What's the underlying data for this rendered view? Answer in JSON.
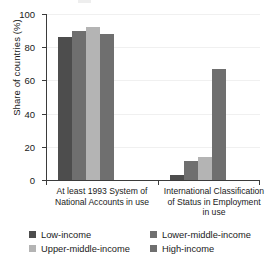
{
  "chart_data": {
    "type": "bar",
    "title": "",
    "xlabel": "",
    "ylabel": "Share of countries (%)",
    "ylim": [
      0,
      100
    ],
    "yticks": [
      0,
      20,
      40,
      60,
      80,
      100
    ],
    "ytick_labels": [
      "0",
      "20",
      "40",
      "60",
      "80",
      "100"
    ],
    "grid": true,
    "legend_position": "bottom",
    "categories": [
      "At least 1993 System of National Accounts in use",
      "International Classification of Status in Employment in use"
    ],
    "category_lines": [
      [
        "At least 1993 System of",
        "National Accounts in use"
      ],
      [
        "International Classification",
        "of Status in Employment",
        "in use"
      ]
    ],
    "series": [
      {
        "name": "Low-income",
        "color": "#4d4d4d",
        "values": [
          86,
          3
        ]
      },
      {
        "name": "Lower-middle-income",
        "color": "#6f6f6f",
        "values": [
          90,
          11.5
        ]
      },
      {
        "name": "Upper-middle-income",
        "color": "#b4b4b4",
        "values": [
          92,
          14
        ]
      },
      {
        "name": "High-income",
        "color": "#6f6f6f",
        "values": [
          88,
          67
        ]
      }
    ]
  },
  "legend": {
    "items": [
      {
        "label": "Low-income"
      },
      {
        "label": "Lower-middle-income"
      },
      {
        "label": "Upper-middle-income"
      },
      {
        "label": "High-income"
      }
    ]
  }
}
